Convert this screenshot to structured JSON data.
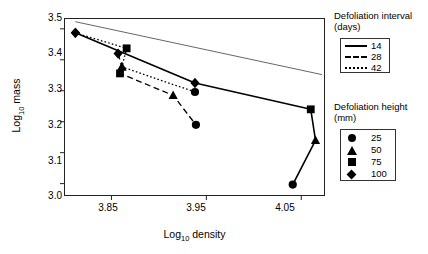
{
  "chart_data": {
    "type": "scatter",
    "title": "",
    "xlabel": "Log10 density",
    "ylabel": "Log10 mass",
    "xlim": [
      3.8,
      4.075
    ],
    "ylim": [
      2.96,
      3.535
    ],
    "xticks": [
      3.85,
      3.95,
      4.05
    ],
    "xticklabels": [
      "3.85",
      "3.95",
      "4.05"
    ],
    "yticks": [
      3.0,
      3.1,
      3.2,
      3.3,
      3.4,
      3.5
    ],
    "yticklabels": [
      "3.0",
      "3.1",
      "3.2",
      "3.3",
      "3.4",
      "3.5"
    ],
    "grid": false,
    "legend_position": "right",
    "reference_line": {
      "name": "self-thinning line",
      "style": "thin-solid",
      "x": [
        3.812,
        4.072
      ],
      "y": [
        3.523,
        3.352
      ]
    },
    "series": [
      {
        "name": "14",
        "interval_days": 14,
        "linestyle": "solid",
        "points": [
          {
            "x": 3.812,
            "y": 3.487,
            "height_mm": 100,
            "marker": "diamond"
          },
          {
            "x": 3.938,
            "y": 3.325,
            "height_mm": 100,
            "marker": "diamond"
          },
          {
            "x": 4.06,
            "y": 3.24,
            "height_mm": 75,
            "marker": "square"
          },
          {
            "x": 4.065,
            "y": 3.14,
            "height_mm": 50,
            "marker": "triangle"
          },
          {
            "x": 4.041,
            "y": 2.997,
            "height_mm": 25,
            "marker": "circle"
          }
        ]
      },
      {
        "name": "28",
        "interval_days": 28,
        "linestyle": "dashed",
        "points": [
          {
            "x": 3.857,
            "y": 3.42,
            "height_mm": 100,
            "marker": "diamond"
          },
          {
            "x": 3.861,
            "y": 3.377,
            "height_mm": 50,
            "marker": "triangle"
          },
          {
            "x": 3.859,
            "y": 3.356,
            "height_mm": 75,
            "marker": "square"
          },
          {
            "x": 3.915,
            "y": 3.285,
            "height_mm": 50,
            "marker": "triangle"
          },
          {
            "x": 3.939,
            "y": 3.19,
            "height_mm": 25,
            "marker": "circle"
          }
        ]
      },
      {
        "name": "42",
        "interval_days": 42,
        "linestyle": "dotted",
        "points": [
          {
            "x": 3.812,
            "y": 3.487,
            "height_mm": 100,
            "marker": "diamond"
          },
          {
            "x": 3.866,
            "y": 3.437,
            "height_mm": 75,
            "marker": "square"
          },
          {
            "x": 3.861,
            "y": 3.377,
            "height_mm": 50,
            "marker": "triangle"
          },
          {
            "x": 3.938,
            "y": 3.296,
            "height_mm": 25,
            "marker": "circle"
          }
        ]
      }
    ],
    "legends": [
      {
        "title_line1": "Defoliation interval",
        "title_line2": "(days)",
        "entries": [
          {
            "label": "14",
            "key": "solid-line"
          },
          {
            "label": "28",
            "key": "dashed-line"
          },
          {
            "label": "42",
            "key": "dotted-line"
          }
        ]
      },
      {
        "title_line1": "Defoliation height",
        "title_line2": "(mm)",
        "entries": [
          {
            "label": "25",
            "key": "circle-marker"
          },
          {
            "label": "50",
            "key": "triangle-marker"
          },
          {
            "label": "75",
            "key": "square-marker"
          },
          {
            "label": "100",
            "key": "diamond-marker"
          }
        ]
      }
    ]
  },
  "axes": {
    "ylabel_prefix": "Log",
    "ylabel_sub": "10",
    "ylabel_suffix": " mass",
    "xlabel_prefix": "Log",
    "xlabel_sub": "10",
    "xlabel_suffix": " density"
  },
  "colors": {
    "foreground": "#000000",
    "frame": "#222222",
    "background": "#ffffff",
    "reference_line": "#555555"
  }
}
